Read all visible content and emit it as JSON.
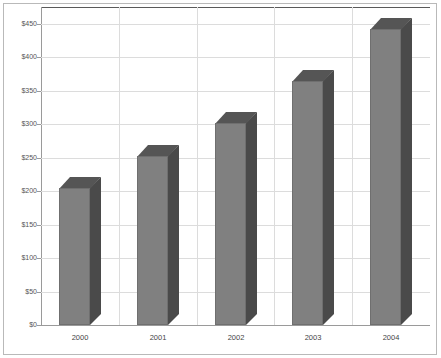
{
  "chart_data": {
    "type": "bar",
    "title": "",
    "xlabel": "",
    "ylabel": "",
    "categories": [
      "2000",
      "2001",
      "2002",
      "2003",
      "2004"
    ],
    "values": [
      205,
      253,
      302,
      365,
      443
    ],
    "ylim": [
      0,
      450
    ],
    "ytick_values": [
      0,
      50,
      100,
      150,
      200,
      250,
      300,
      350,
      400,
      450
    ],
    "ytick_labels": [
      "$0",
      "$50",
      "$100",
      "$150",
      "$200",
      "$250",
      "$300",
      "$350",
      "$400",
      "$450"
    ],
    "grid": true,
    "legend": "none",
    "style": "3d-bar",
    "colors": {
      "bar_front": "#808080",
      "bar_side": "#4a4a4a",
      "bar_top": "#555555",
      "gridline": "#dcdcdc",
      "axis": "#9a9a9a",
      "frame": "#b9b9b9",
      "text": "#555555",
      "background": "#ffffff"
    }
  }
}
